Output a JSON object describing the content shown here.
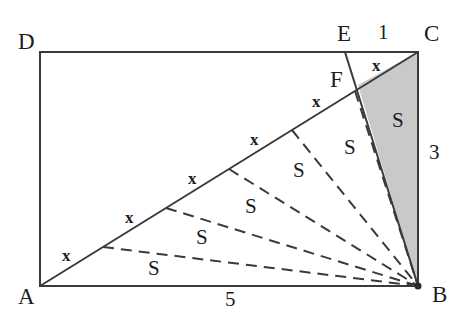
{
  "figure": {
    "colors": {
      "stroke": "#3a3a3a",
      "shade_fill": "#c9c9c9",
      "text": "#1d1d1d",
      "background": "#ffffff"
    }
  },
  "vertices": [
    {
      "name": "D",
      "label": "D",
      "x": 40,
      "y": 52
    },
    {
      "name": "A",
      "label": "A",
      "x": 40,
      "y": 286
    },
    {
      "name": "B",
      "label": "B",
      "x": 418,
      "y": 286
    },
    {
      "name": "C",
      "label": "C",
      "x": 418,
      "y": 52
    },
    {
      "name": "E",
      "label": "E",
      "x": 345,
      "y": 52
    },
    {
      "name": "F",
      "label": "F",
      "x": 358,
      "y": 85
    }
  ],
  "vertex_labels": [
    {
      "name": "vertex-label-D",
      "text": "D",
      "left": 18,
      "top": 30
    },
    {
      "name": "vertex-label-A",
      "text": "A",
      "left": 18,
      "top": 285
    },
    {
      "name": "vertex-label-B",
      "text": "B",
      "left": 432,
      "top": 283
    },
    {
      "name": "vertex-label-C",
      "text": "C",
      "left": 424,
      "top": 22
    },
    {
      "name": "vertex-label-E",
      "text": "E",
      "left": 337,
      "top": 22
    },
    {
      "name": "vertex-label-F",
      "text": "F",
      "left": 330,
      "top": 68
    }
  ],
  "measures": [
    {
      "name": "side-length-AB",
      "text": "5",
      "left": 225,
      "top": 289
    },
    {
      "name": "side-length-BC",
      "text": "3",
      "left": 429,
      "top": 142
    },
    {
      "name": "segment-length-EC",
      "text": "1",
      "left": 378,
      "top": 22
    }
  ],
  "equal_segments": {
    "label": "x",
    "count": 6,
    "description": "Diagonal AC is divided into six equal segments each marked x",
    "marks": [
      {
        "name": "segment-mark-x-1",
        "text": "x",
        "left": 62,
        "top": 247
      },
      {
        "name": "segment-mark-x-2",
        "text": "x",
        "left": 125,
        "top": 209
      },
      {
        "name": "segment-mark-x-3",
        "text": "x",
        "left": 188,
        "top": 170
      },
      {
        "name": "segment-mark-x-4",
        "text": "x",
        "left": 250,
        "top": 131
      },
      {
        "name": "segment-mark-x-5",
        "text": "x",
        "left": 312,
        "top": 93
      },
      {
        "name": "segment-mark-x-6",
        "text": "x",
        "left": 372,
        "top": 57
      }
    ]
  },
  "equal_areas": {
    "label": "S",
    "count": 6,
    "description": "Six triangles of equal area S formed by cevians from B to the division points of AC",
    "marks": [
      {
        "name": "area-mark-S-1",
        "text": "S",
        "left": 148,
        "top": 258
      },
      {
        "name": "area-mark-S-2",
        "text": "S",
        "left": 196,
        "top": 227
      },
      {
        "name": "area-mark-S-3",
        "text": "S",
        "left": 245,
        "top": 196
      },
      {
        "name": "area-mark-S-4",
        "text": "S",
        "left": 293,
        "top": 160
      },
      {
        "name": "area-mark-S-5",
        "text": "S",
        "left": 344,
        "top": 137
      },
      {
        "name": "area-mark-S-6-shaded",
        "text": "S",
        "left": 392,
        "top": 110
      }
    ]
  },
  "geometry": {
    "rectangle": {
      "name": "rectangle-ABCD",
      "x": 40,
      "y": 52,
      "width": 378,
      "height": 234
    },
    "diagonal": {
      "name": "diagonal-AC",
      "x1": 40,
      "y1": 286,
      "x2": 418,
      "y2": 52
    },
    "cevian_solid": {
      "name": "cevian-EB",
      "x1": 345,
      "y1": 52,
      "x2": 418,
      "y2": 286
    },
    "shaded_triangle": {
      "name": "shaded-triangle-FCB",
      "points": "358,85 418,52 418,286"
    },
    "dashed_cevians": [
      {
        "name": "dashed-cevian-B-P1",
        "x1": 103,
        "y1": 247,
        "x2": 418,
        "y2": 286
      },
      {
        "name": "dashed-cevian-B-P2",
        "x1": 166,
        "y1": 208,
        "x2": 418,
        "y2": 286
      },
      {
        "name": "dashed-cevian-B-P3",
        "x1": 229,
        "y1": 169,
        "x2": 418,
        "y2": 286
      },
      {
        "name": "dashed-cevian-B-P4",
        "x1": 292,
        "y1": 130,
        "x2": 418,
        "y2": 286
      },
      {
        "name": "dashed-cevian-B-P5",
        "x1": 355,
        "y1": 91,
        "x2": 418,
        "y2": 286
      }
    ]
  }
}
